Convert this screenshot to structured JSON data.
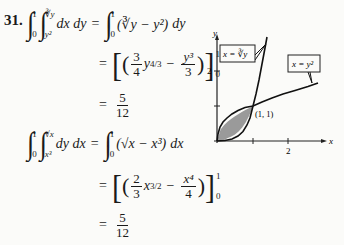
{
  "problem": {
    "number": "31.",
    "part1": {
      "lhs": {
        "outer_lower": "0",
        "outer_upper": "1",
        "inner_lower": "y²",
        "inner_upper": "∛y",
        "differentials": "dx dy"
      },
      "step1": {
        "lower": "0",
        "upper": "1",
        "integrand": "(∛y − y²)",
        "differential": "dy"
      },
      "step2": {
        "coef_num": "3",
        "coef_den": "4",
        "term1_var": "y",
        "term1_exp": "4/3",
        "minus": "−",
        "term2_num": "y³",
        "term2_den": "3",
        "eval_lower": "0",
        "eval_upper": "1"
      },
      "result": {
        "num": "5",
        "den": "12"
      }
    },
    "part2": {
      "lhs": {
        "outer_lower": "0",
        "outer_upper": "1",
        "inner_lower": "x³",
        "inner_upper": "√x",
        "differentials": "dy dx"
      },
      "step1": {
        "lower": "0",
        "upper": "1",
        "integrand": "(√x − x³)",
        "differential": "dx"
      },
      "step2": {
        "coef_num": "2",
        "coef_den": "3",
        "term1_var": "x",
        "term1_exp": "3/2",
        "minus": "−",
        "term2_num": "x⁴",
        "term2_den": "4",
        "eval_lower": "0",
        "eval_upper": "1"
      },
      "result": {
        "num": "5",
        "den": "12"
      }
    },
    "equals": "="
  },
  "graph": {
    "x_axis_label": "x",
    "y_axis_label": "y",
    "x_ticks": [
      "1",
      "2"
    ],
    "y_ticks": [
      "1",
      "2"
    ],
    "y_tick_label_shown": "2",
    "x_tick_label_shown": "2",
    "curve1_label": "x = ∛y",
    "curve2_label": "x = y²",
    "intersection_label": "(1, 1)",
    "shade_color": "#8a8a8a"
  }
}
